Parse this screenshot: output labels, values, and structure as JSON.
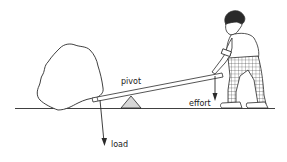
{
  "diagram": {
    "labels": {
      "pivot": "pivot",
      "effort": "effort",
      "load": "load"
    },
    "colors": {
      "line": "#2a2a2a",
      "pivot_fill": "#d8d8d8",
      "background": "#ffffff"
    }
  }
}
